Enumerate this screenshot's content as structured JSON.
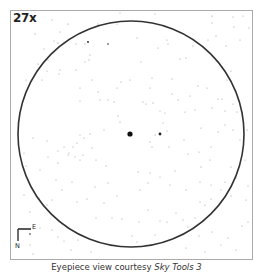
{
  "eyepiece": {
    "magnification": "27x",
    "frame": {
      "x": 10,
      "y": 10,
      "w": 242,
      "h": 249,
      "stroke": "#aaaaaa"
    },
    "field_circle": {
      "cx": 131,
      "cy": 134,
      "r": 113,
      "stroke": "#333333"
    },
    "compass": {
      "north_label": "N",
      "east_label": "E"
    },
    "central_object": {
      "x": 130,
      "y": 134,
      "r": 2.6
    }
  },
  "caption": {
    "prefix": "Eyepiece view courtesy ",
    "software": "Sky Tools 3"
  },
  "stars": [
    [
      52,
      20,
      0.5
    ],
    [
      68,
      24,
      0.6
    ],
    [
      60,
      32,
      0.5
    ],
    [
      98,
      24,
      0.5
    ],
    [
      117,
      24,
      0.5
    ],
    [
      120,
      13,
      0.5
    ],
    [
      155,
      14,
      0.5
    ],
    [
      212,
      16,
      0.6
    ],
    [
      212,
      23,
      0.5
    ],
    [
      233,
      17,
      0.5
    ],
    [
      243,
      16,
      0.5
    ],
    [
      234,
      27,
      0.5
    ],
    [
      249,
      28,
      0.5
    ],
    [
      216,
      36,
      0.6
    ],
    [
      226,
      46,
      0.5
    ],
    [
      240,
      40,
      0.5
    ],
    [
      208,
      40,
      0.5
    ],
    [
      35,
      34,
      0.6
    ],
    [
      38,
      64,
      0.6
    ],
    [
      26,
      80,
      0.5
    ],
    [
      42,
      80,
      0.5
    ],
    [
      48,
      60,
      0.5
    ],
    [
      44,
      49,
      0.5
    ],
    [
      54,
      41,
      0.5
    ],
    [
      58,
      43,
      0.6
    ],
    [
      64,
      42,
      0.5
    ],
    [
      47,
      71,
      0.5
    ],
    [
      76,
      44,
      0.5
    ],
    [
      85,
      44,
      0.6
    ],
    [
      88,
      42,
      0.9
    ],
    [
      108,
      44,
      0.8
    ],
    [
      90,
      55,
      0.5
    ],
    [
      76,
      70,
      0.5
    ],
    [
      60,
      70,
      0.5
    ],
    [
      59,
      74,
      0.5
    ],
    [
      85,
      62,
      0.5
    ],
    [
      80,
      88,
      0.5
    ],
    [
      92,
      80,
      0.5
    ],
    [
      98,
      92,
      0.5
    ],
    [
      117,
      88,
      0.5
    ],
    [
      121,
      82,
      0.5
    ],
    [
      130,
      80,
      0.5
    ],
    [
      89,
      60,
      0.6
    ],
    [
      80,
      101,
      0.5
    ],
    [
      100,
      100,
      0.5
    ],
    [
      108,
      100,
      0.5
    ],
    [
      114,
      102,
      0.5
    ],
    [
      118,
      116,
      0.6
    ],
    [
      120,
      122,
      0.6
    ],
    [
      104,
      130,
      0.5
    ],
    [
      90,
      134,
      0.5
    ],
    [
      80,
      135,
      0.5
    ],
    [
      92,
      148,
      0.5
    ],
    [
      84,
      138,
      0.5
    ],
    [
      77,
      143,
      0.5
    ],
    [
      73,
      147,
      0.5
    ],
    [
      64,
      147,
      0.5
    ],
    [
      137,
      38,
      0.5
    ],
    [
      167,
      40,
      0.5
    ],
    [
      168,
      44,
      0.5
    ],
    [
      158,
      48,
      0.5
    ],
    [
      186,
      36,
      0.5
    ],
    [
      193,
      46,
      0.5
    ],
    [
      180,
      59,
      0.5
    ],
    [
      186,
      58,
      0.5
    ],
    [
      141,
      62,
      0.5
    ],
    [
      152,
      78,
      0.5
    ],
    [
      172,
      79,
      0.5
    ],
    [
      150,
      88,
      0.5
    ],
    [
      172,
      94,
      0.5
    ],
    [
      190,
      96,
      0.5
    ],
    [
      198,
      86,
      0.5
    ],
    [
      207,
      88,
      0.5
    ],
    [
      222,
      67,
      0.5
    ],
    [
      231,
      71,
      0.5
    ],
    [
      227,
      80,
      0.5
    ],
    [
      218,
      99,
      0.5
    ],
    [
      222,
      99,
      0.5
    ],
    [
      233,
      104,
      0.5
    ],
    [
      178,
      100,
      0.5
    ],
    [
      185,
      112,
      0.5
    ],
    [
      165,
      113,
      0.5
    ],
    [
      160,
      111,
      0.5
    ],
    [
      195,
      110,
      0.5
    ],
    [
      212,
      108,
      0.5
    ],
    [
      225,
      111,
      0.5
    ],
    [
      237,
      112,
      0.5
    ],
    [
      143,
      102,
      0.5
    ],
    [
      146,
      104,
      0.5
    ],
    [
      153,
      103,
      0.6
    ],
    [
      160,
      134,
      1.4
    ],
    [
      163,
      123,
      0.5
    ],
    [
      167,
      131,
      0.5
    ],
    [
      155,
      135,
      0.5
    ],
    [
      150,
      142,
      0.5
    ],
    [
      152,
      147,
      0.5
    ],
    [
      169,
      147,
      0.5
    ],
    [
      184,
      140,
      0.5
    ],
    [
      201,
      128,
      0.5
    ],
    [
      218,
      132,
      0.5
    ],
    [
      225,
      125,
      0.5
    ],
    [
      233,
      130,
      0.5
    ],
    [
      240,
      140,
      0.5
    ],
    [
      247,
      130,
      0.5
    ],
    [
      211,
      147,
      0.5
    ],
    [
      199,
      152,
      0.5
    ],
    [
      188,
      154,
      0.5
    ],
    [
      210,
      160,
      0.5
    ],
    [
      24,
      153,
      0.5
    ],
    [
      33,
      138,
      0.5
    ],
    [
      47,
      141,
      0.5
    ],
    [
      48,
      157,
      0.5
    ],
    [
      58,
      151,
      0.5
    ],
    [
      69,
      153,
      0.5
    ],
    [
      75,
      157,
      0.5
    ],
    [
      80,
      160,
      0.5
    ],
    [
      83,
      155,
      0.5
    ],
    [
      26,
      166,
      0.5
    ],
    [
      40,
      170,
      0.5
    ],
    [
      58,
      163,
      0.6
    ],
    [
      68,
      155,
      0.5
    ],
    [
      56,
      180,
      0.5
    ],
    [
      62,
      190,
      0.5
    ],
    [
      72,
      182,
      0.5
    ],
    [
      77,
      202,
      0.5
    ],
    [
      87,
      199,
      0.5
    ],
    [
      52,
      200,
      0.5
    ],
    [
      47,
      205,
      0.5
    ],
    [
      24,
      195,
      0.5
    ],
    [
      30,
      212,
      0.5
    ],
    [
      39,
      198,
      0.5
    ],
    [
      95,
      187,
      0.5
    ],
    [
      96,
      160,
      0.5
    ],
    [
      106,
      166,
      0.5
    ],
    [
      108,
      183,
      0.5
    ],
    [
      117,
      196,
      0.5
    ],
    [
      104,
      203,
      0.5
    ],
    [
      96,
      218,
      0.5
    ],
    [
      112,
      218,
      0.5
    ],
    [
      138,
      172,
      0.5
    ],
    [
      150,
      173,
      0.5
    ],
    [
      140,
      190,
      0.5
    ],
    [
      148,
      183,
      0.5
    ],
    [
      160,
      177,
      0.5
    ],
    [
      170,
      185,
      0.5
    ],
    [
      175,
      171,
      0.5
    ],
    [
      186,
      190,
      0.5
    ],
    [
      200,
      182,
      0.5
    ],
    [
      201,
      167,
      0.6
    ],
    [
      211,
      185,
      0.5
    ],
    [
      221,
      190,
      0.5
    ],
    [
      231,
      196,
      0.5
    ],
    [
      200,
      202,
      0.5
    ],
    [
      205,
      205,
      0.5
    ],
    [
      211,
      199,
      0.5
    ],
    [
      225,
      182,
      0.5
    ],
    [
      231,
      167,
      0.5
    ],
    [
      236,
      178,
      0.5
    ],
    [
      245,
      160,
      0.5
    ],
    [
      176,
      213,
      0.5
    ],
    [
      183,
      220,
      0.5
    ],
    [
      188,
      227,
      0.5
    ],
    [
      195,
      218,
      0.5
    ],
    [
      160,
      221,
      0.5
    ],
    [
      167,
      222,
      0.5
    ],
    [
      148,
      210,
      0.5
    ],
    [
      139,
      222,
      0.5
    ],
    [
      132,
      236,
      0.5
    ],
    [
      122,
      219,
      0.5
    ],
    [
      155,
      235,
      0.5
    ],
    [
      137,
      242,
      0.5
    ],
    [
      146,
      245,
      0.5
    ],
    [
      175,
      238,
      0.5
    ],
    [
      199,
      236,
      0.5
    ],
    [
      212,
      232,
      0.5
    ],
    [
      221,
      245,
      0.5
    ],
    [
      236,
      250,
      0.5
    ],
    [
      242,
      226,
      0.5
    ],
    [
      58,
      237,
      0.5
    ],
    [
      64,
      241,
      0.5
    ],
    [
      78,
      240,
      0.5
    ],
    [
      91,
      252,
      0.5
    ],
    [
      71,
      250,
      0.5
    ],
    [
      52,
      230,
      0.5
    ],
    [
      40,
      228,
      0.5
    ],
    [
      30,
      234,
      0.8
    ],
    [
      33,
      254,
      0.5
    ],
    [
      30,
      245,
      0.5
    ],
    [
      186,
      248,
      0.5
    ],
    [
      205,
      252,
      0.5
    ],
    [
      228,
      238,
      0.5
    ],
    [
      248,
      222,
      0.5
    ],
    [
      246,
      200,
      0.5
    ],
    [
      248,
      186,
      0.5
    ]
  ]
}
